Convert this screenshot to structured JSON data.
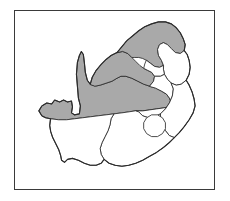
{
  "figure": {
    "kind": "choropleth-map",
    "frame": {
      "border_color": "#3a3a3a",
      "background_color": "#ffffff"
    },
    "page_background": "#ffffff"
  },
  "legend_colors": {
    "shaded_fill": "#a9a9a9",
    "plain_fill": "#ffffff",
    "boundary_stroke": "#2b2b2b"
  },
  "regions": [
    {
      "id": "limpopo",
      "name": "Limpopo",
      "shaded": true,
      "fill": "#a9a9a9"
    },
    {
      "id": "north-west",
      "name": "North West",
      "shaded": true,
      "fill": "#a9a9a9"
    },
    {
      "id": "northern-cape",
      "name": "Northern Cape",
      "shaded": true,
      "fill": "#a9a9a9"
    },
    {
      "id": "mpumalanga",
      "name": "Mpumalanga",
      "shaded": false,
      "fill": "#ffffff"
    },
    {
      "id": "gauteng",
      "name": "Gauteng",
      "shaded": false,
      "fill": "#ffffff"
    },
    {
      "id": "free-state",
      "name": "Free State",
      "shaded": false,
      "fill": "#ffffff"
    },
    {
      "id": "kwazulu-natal",
      "name": "KwaZulu-Natal",
      "shaded": false,
      "fill": "#ffffff"
    },
    {
      "id": "eastern-cape",
      "name": "Eastern Cape",
      "shaded": false,
      "fill": "#ffffff"
    },
    {
      "id": "western-cape",
      "name": "Western Cape",
      "shaded": false,
      "fill": "#ffffff"
    },
    {
      "id": "lesotho",
      "name": "Lesotho",
      "shaded": false,
      "fill": "#ffffff"
    }
  ],
  "labels": []
}
